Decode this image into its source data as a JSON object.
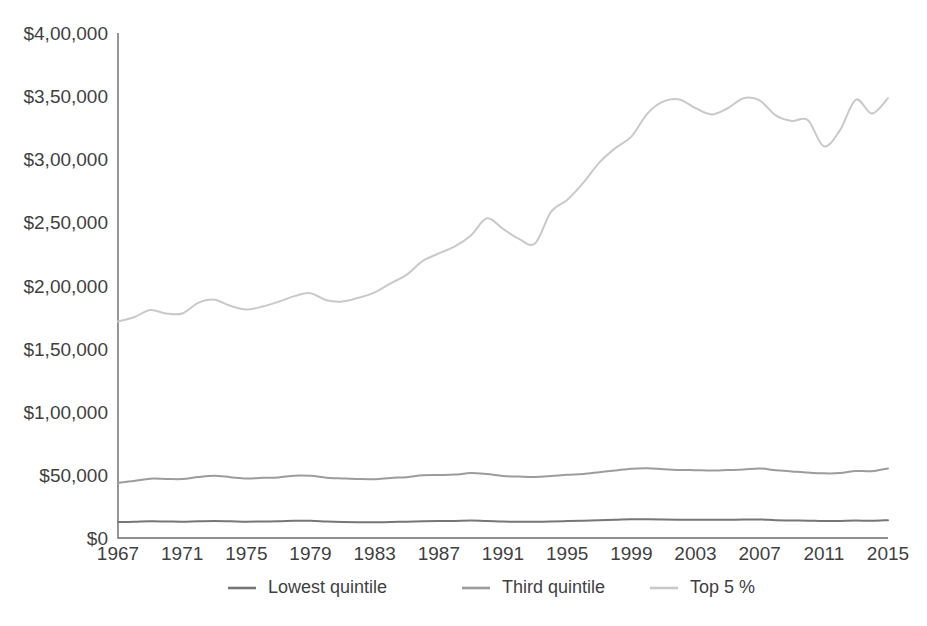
{
  "chart_data": {
    "type": "line",
    "title": "",
    "subtitle": "",
    "xlabel": "",
    "ylabel": "",
    "xlim": [
      1967,
      2015
    ],
    "ylim": [
      0,
      400000
    ],
    "grid": false,
    "legend_position": "bottom",
    "y_ticks": [
      0,
      50000,
      100000,
      150000,
      200000,
      250000,
      300000,
      350000,
      400000
    ],
    "y_tick_labels": [
      "$0",
      "$50,000",
      "$1,00,000",
      "$1,50,000",
      "$2,00,000",
      "$2,50,000",
      "$3,00,000",
      "$3,50,000",
      "$4,00,000"
    ],
    "x_ticks": [
      1967,
      1971,
      1975,
      1979,
      1983,
      1987,
      1991,
      1995,
      1999,
      2003,
      2007,
      2011,
      2015
    ],
    "x_tick_labels": [
      "1967",
      "1971",
      "1975",
      "1979",
      "1983",
      "1987",
      "1991",
      "1995",
      "1999",
      "2003",
      "2007",
      "2011",
      "2015"
    ],
    "x": [
      1967,
      1968,
      1969,
      1970,
      1971,
      1972,
      1973,
      1974,
      1975,
      1976,
      1977,
      1978,
      1979,
      1980,
      1981,
      1982,
      1983,
      1984,
      1985,
      1986,
      1987,
      1988,
      1989,
      1990,
      1991,
      1992,
      1993,
      1994,
      1995,
      1996,
      1997,
      1998,
      1999,
      2000,
      2001,
      2002,
      2003,
      2004,
      2005,
      2006,
      2007,
      2008,
      2009,
      2010,
      2011,
      2012,
      2013,
      2014,
      2015
    ],
    "series": [
      {
        "name": "Lowest quintile",
        "color": "#767676",
        "values": [
          12600,
          12800,
          13200,
          13100,
          12900,
          13300,
          13500,
          13300,
          12900,
          13100,
          13200,
          13600,
          13600,
          13100,
          12700,
          12500,
          12400,
          12700,
          12900,
          13200,
          13400,
          13500,
          13800,
          13500,
          13000,
          12900,
          12800,
          13000,
          13400,
          13600,
          14000,
          14400,
          14900,
          14900,
          14700,
          14500,
          14500,
          14400,
          14500,
          14600,
          14700,
          14100,
          13900,
          13700,
          13400,
          13500,
          13800,
          13600,
          14100
        ]
      },
      {
        "name": "Third quintile",
        "color": "#9c9c9c",
        "values": [
          43800,
          45200,
          47000,
          46800,
          46700,
          48300,
          49300,
          48200,
          47100,
          47700,
          48000,
          49400,
          49300,
          47800,
          47200,
          46700,
          46600,
          47600,
          48200,
          49700,
          49900,
          50200,
          51400,
          50600,
          49200,
          48700,
          48400,
          49100,
          50100,
          50700,
          52100,
          53500,
          54900,
          55300,
          54500,
          53900,
          53700,
          53400,
          53800,
          54200,
          55100,
          53600,
          52700,
          51800,
          51200,
          51400,
          53100,
          52900,
          55100
        ]
      },
      {
        "name": "Top 5 %",
        "color": "#c9c9c9",
        "values": [
          171500,
          174800,
          180600,
          177800,
          177800,
          186200,
          188800,
          183900,
          181000,
          183300,
          187100,
          191600,
          193900,
          188300,
          187300,
          190300,
          194600,
          201700,
          208600,
          219500,
          225400,
          230900,
          239600,
          253200,
          244800,
          236900,
          233300,
          258500,
          267800,
          281300,
          297300,
          308800,
          317900,
          336200,
          345800,
          347400,
          340500,
          335500,
          340400,
          348300,
          346600,
          334700,
          330300,
          331100,
          310300,
          322900,
          347200,
          336200,
          348400
        ]
      }
    ]
  },
  "legend": {
    "items": [
      {
        "label": "Lowest quintile",
        "color": "#767676"
      },
      {
        "label": "Third quintile",
        "color": "#9c9c9c"
      },
      {
        "label": "Top 5 %",
        "color": "#c9c9c9"
      }
    ]
  },
  "axis": {
    "axis_color": "#6b6b6b",
    "tick_text_color": "#3f3f3f"
  }
}
